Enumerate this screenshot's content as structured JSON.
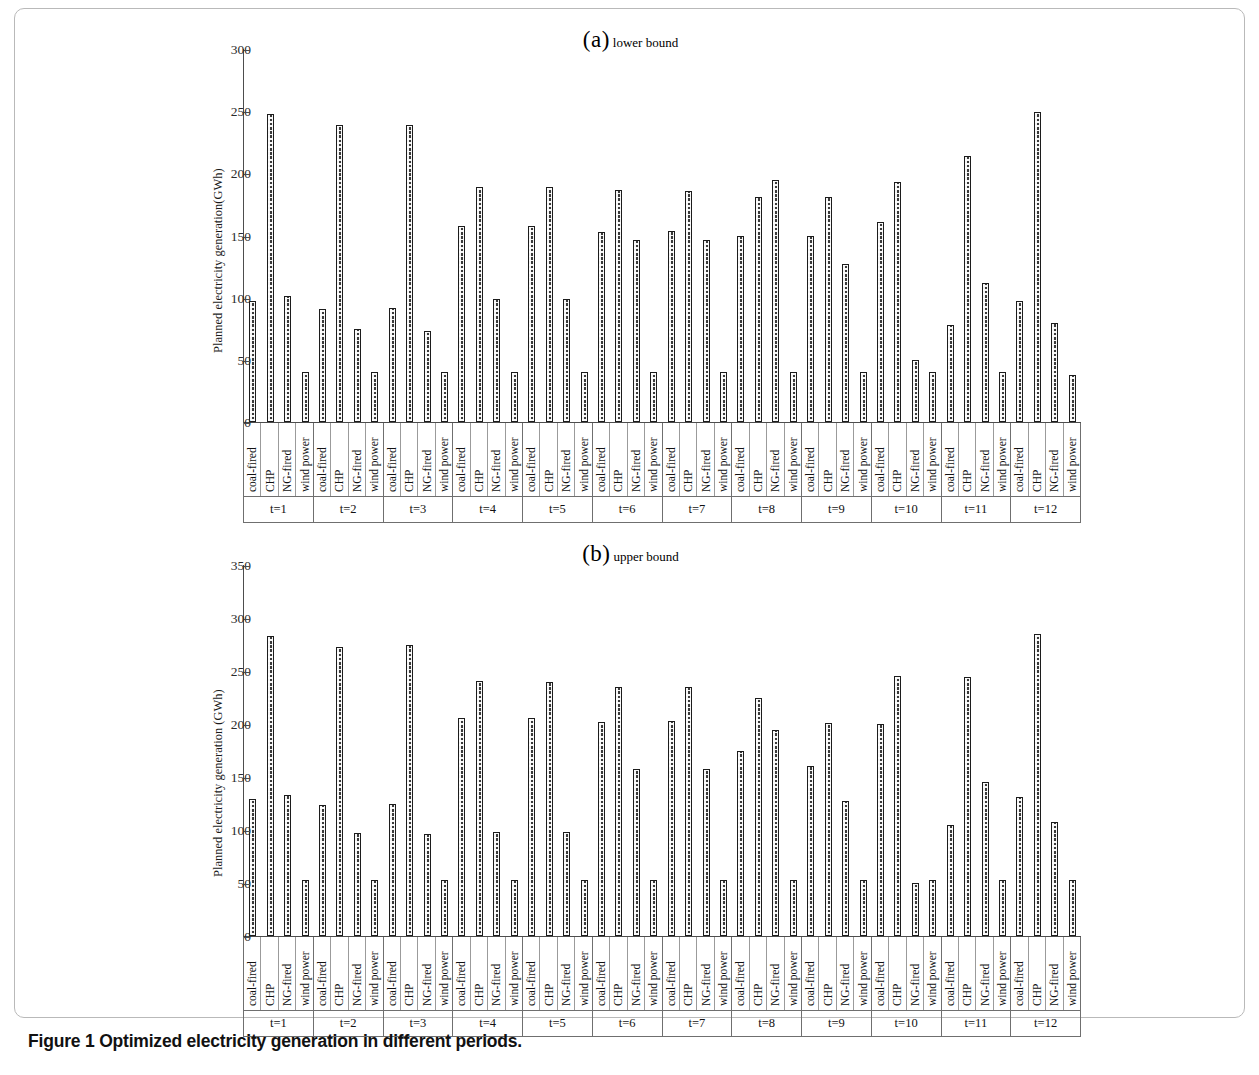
{
  "caption": "Figure 1 Optimized electricity generation in different periods.",
  "panels": {
    "a": {
      "title_label": "(a)",
      "title_sub": "lower bound",
      "ylabel": "Planned electricity generation(GWh)"
    },
    "b": {
      "title_label": "(b)",
      "title_sub": "upper bound",
      "ylabel": "Planned electricity generation (GWh)"
    }
  },
  "chart_data": [
    {
      "type": "bar",
      "title": "(a) lower bound",
      "xlabel": "",
      "ylabel": "Planned electricity generation(GWh)",
      "ylim": [
        0,
        300
      ],
      "yticks": [
        0,
        50,
        100,
        150,
        200,
        250,
        300
      ],
      "grid": false,
      "legend": "none",
      "categories": [
        "coal-fired",
        "CHP",
        "NG-fired",
        "wind power"
      ],
      "groups": [
        "t=1",
        "t=2",
        "t=3",
        "t=4",
        "t=5",
        "t=6",
        "t=7",
        "t=8",
        "t=9",
        "t=10",
        "t=11",
        "t=12"
      ],
      "series": [
        {
          "name": "coal-fired",
          "values": [
            97,
            91,
            92,
            158,
            158,
            153,
            154,
            150,
            150,
            161,
            78,
            97
          ]
        },
        {
          "name": "CHP",
          "values": [
            248,
            239,
            239,
            189,
            189,
            187,
            186,
            181,
            181,
            193,
            214,
            249
          ]
        },
        {
          "name": "NG-fired",
          "values": [
            101,
            75,
            73,
            99,
            99,
            146,
            146,
            195,
            127,
            50,
            112,
            80
          ]
        },
        {
          "name": "wind power",
          "values": [
            40,
            40,
            40,
            40,
            40,
            40,
            40,
            40,
            40,
            40,
            40,
            38
          ]
        }
      ]
    },
    {
      "type": "bar",
      "title": "(b) upper bound",
      "xlabel": "",
      "ylabel": "Planned electricity generation (GWh)",
      "ylim": [
        0,
        350
      ],
      "yticks": [
        0,
        50,
        100,
        150,
        200,
        250,
        300,
        350
      ],
      "grid": false,
      "legend": "none",
      "categories": [
        "coal-fired",
        "CHP",
        "NG-fired",
        "wind power"
      ],
      "groups": [
        "t=1",
        "t=2",
        "t=3",
        "t=4",
        "t=5",
        "t=6",
        "t=7",
        "t=8",
        "t=9",
        "t=10",
        "t=11",
        "t=12"
      ],
      "series": [
        {
          "name": "coal-fired",
          "values": [
            129,
            124,
            125,
            206,
            206,
            202,
            203,
            175,
            160,
            200,
            105,
            131
          ]
        },
        {
          "name": "CHP",
          "values": [
            283,
            273,
            275,
            241,
            240,
            235,
            235,
            225,
            201,
            245,
            244,
            285
          ]
        },
        {
          "name": "NG-fired",
          "values": [
            133,
            97,
            96,
            98,
            98,
            158,
            158,
            194,
            127,
            50,
            145,
            108
          ]
        },
        {
          "name": "wind power",
          "values": [
            53,
            53,
            53,
            53,
            53,
            53,
            53,
            53,
            53,
            53,
            53,
            53
          ]
        }
      ]
    }
  ]
}
